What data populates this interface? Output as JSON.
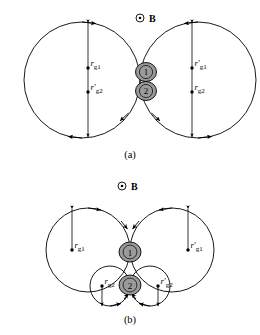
{
  "figure": {
    "title": "",
    "background": "#ffffff",
    "line_color": "#000000",
    "particle_fill": "#9a9a9a",
    "panels": [
      {
        "id": "panel-a",
        "caption": "(a)",
        "field_symbol": "⊙",
        "field_label": "B",
        "particles": [
          {
            "id": "particle-1",
            "label": "1"
          },
          {
            "id": "particle-2",
            "label": "2"
          }
        ],
        "radius_labels": [
          {
            "id": "label-left-upper",
            "symbol": "r",
            "prime": "",
            "subscript": "g1"
          },
          {
            "id": "label-left-lower",
            "symbol": "r",
            "prime": "′",
            "subscript": "g2"
          },
          {
            "id": "label-right-upper",
            "symbol": "r",
            "prime": "′",
            "subscript": "g1"
          },
          {
            "id": "label-right-lower",
            "symbol": "r",
            "prime": "",
            "subscript": "g2"
          }
        ]
      },
      {
        "id": "panel-b",
        "caption": "(b)",
        "field_symbol": "⊙",
        "field_label": "B",
        "particles": [
          {
            "id": "particle-1",
            "label": "1"
          },
          {
            "id": "particle-2",
            "label": "2"
          }
        ],
        "radius_labels": [
          {
            "id": "label-outer-left",
            "symbol": "r",
            "prime": "",
            "subscript": "g1"
          },
          {
            "id": "label-inner-left",
            "symbol": "r",
            "prime": "",
            "subscript": "g2"
          },
          {
            "id": "label-inner-right",
            "symbol": "r",
            "prime": "′",
            "subscript": "g2"
          },
          {
            "id": "label-outer-right",
            "symbol": "r",
            "prime": "′",
            "subscript": "g1"
          }
        ]
      }
    ]
  }
}
